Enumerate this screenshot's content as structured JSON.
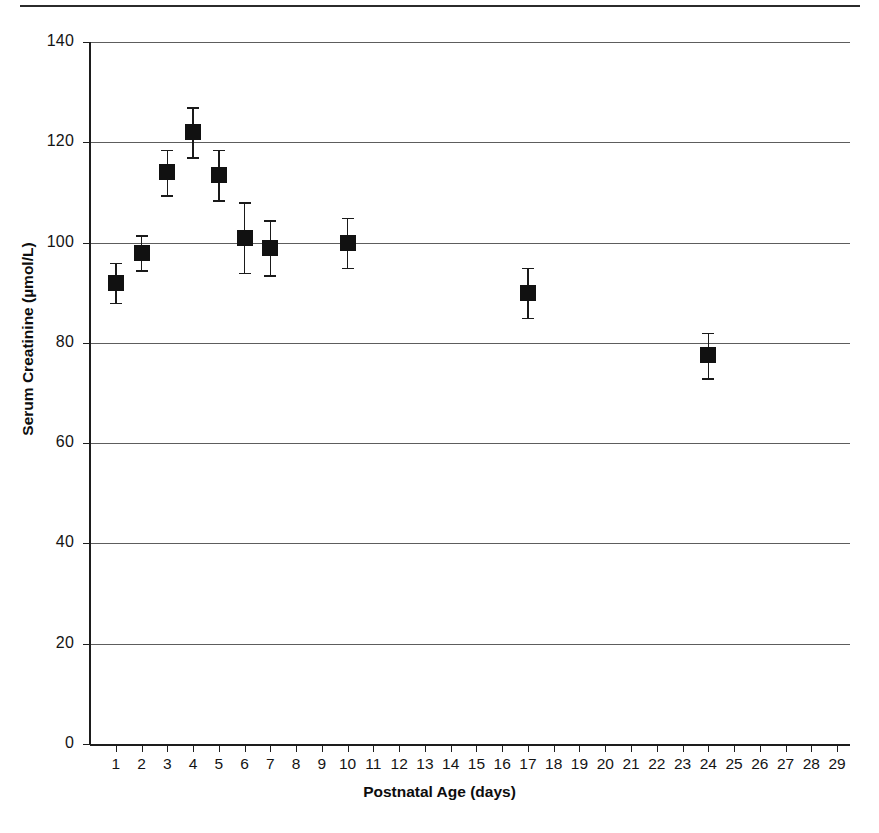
{
  "chart_data": {
    "type": "scatter",
    "title": "",
    "xlabel": "Postnatal Age (days)",
    "ylabel": "Serum Creatinine (µmol/L)",
    "xlim": [
      0,
      29.5
    ],
    "ylim": [
      0,
      140
    ],
    "grid": true,
    "legend": null,
    "error_bars": "vertical, symmetric (mean ± SEM)",
    "marker": "filled black square",
    "x": [
      1,
      2,
      3,
      4,
      5,
      6,
      7,
      10,
      17,
      24
    ],
    "y": [
      92,
      98,
      114,
      122,
      113.5,
      101,
      99,
      100,
      90,
      77.5
    ],
    "yerr": [
      4,
      3.5,
      4.5,
      5,
      5,
      7,
      5.5,
      5,
      5,
      4.5
    ],
    "xtick_labels": [
      "1",
      "2",
      "3",
      "4",
      "5",
      "6",
      "7",
      "8",
      "9",
      "10",
      "11",
      "12",
      "13",
      "14",
      "15",
      "16",
      "17",
      "18",
      "19",
      "20",
      "21",
      "22",
      "23",
      "24",
      "25",
      "26",
      "27",
      "28",
      "29"
    ],
    "ytick_labels": [
      "0",
      "20",
      "40",
      "60",
      "80",
      "100",
      "120",
      "140"
    ],
    "ytick_values": [
      0,
      20,
      40,
      60,
      80,
      100,
      120,
      140
    ],
    "points": [
      {
        "day": 1,
        "value": 92,
        "error": 4,
        "lower": 88,
        "upper": 96
      },
      {
        "day": 2,
        "value": 98,
        "error": 3.5,
        "lower": 94.5,
        "upper": 101.5
      },
      {
        "day": 3,
        "value": 114,
        "error": 4.5,
        "lower": 109.5,
        "upper": 118.5
      },
      {
        "day": 4,
        "value": 122,
        "error": 5,
        "lower": 117,
        "upper": 127
      },
      {
        "day": 5,
        "value": 113.5,
        "error": 5,
        "lower": 108.5,
        "upper": 118.5
      },
      {
        "day": 6,
        "value": 101,
        "error": 7,
        "lower": 94,
        "upper": 108
      },
      {
        "day": 7,
        "value": 99,
        "error": 5.5,
        "lower": 93.5,
        "upper": 104.5
      },
      {
        "day": 10,
        "value": 100,
        "error": 5,
        "lower": 95,
        "upper": 105
      },
      {
        "day": 17,
        "value": 90,
        "error": 5,
        "lower": 85,
        "upper": 95
      },
      {
        "day": 24,
        "value": 77.5,
        "error": 4.5,
        "lower": 73,
        "upper": 82
      }
    ]
  },
  "colors": {
    "marker": "#111111",
    "gridline": "#5d5d5d",
    "axis": "#1d1d1d",
    "text": "#141414",
    "background": "#ffffff",
    "page_rule": "#2b2b2b"
  }
}
